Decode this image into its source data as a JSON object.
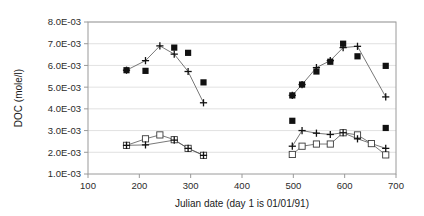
{
  "chart_data": {
    "type": "scatter",
    "title": "",
    "xlabel": "Julian date (day 1 is 01/01/91)",
    "ylabel": "DOC (mole/l)",
    "xlim": [
      100,
      700
    ],
    "ylim": [
      0.001,
      0.008
    ],
    "xticks": [
      100,
      200,
      300,
      400,
      500,
      600,
      700
    ],
    "xtick_labels": [
      "100",
      "200",
      "300",
      "400",
      "500",
      "600",
      "700"
    ],
    "yticks": [
      0.001,
      0.002,
      0.003,
      0.004,
      0.005,
      0.006,
      0.007,
      0.008
    ],
    "ytick_labels": [
      "1.0E-03",
      "2.0E-03",
      "3.0E-03",
      "4.0E-03",
      "5.0E-03",
      "6.0E-03",
      "7.0E-03",
      "8.0E-03"
    ],
    "grid": true,
    "grid_axis": "y",
    "legend": "none",
    "legend_position": "none",
    "marker_colors": {
      "filled_square": "#111111",
      "open_square": "#ffffff",
      "plus": "#111111",
      "line": "#555555"
    },
    "series": [
      {
        "name": "upper-filled-square",
        "marker": "filled-square",
        "connected": false,
        "x": [
          175,
          212,
          268,
          295,
          325,
          498,
          517,
          545,
          572,
          597,
          625,
          680
        ],
        "y": [
          0.00578,
          0.00575,
          0.00682,
          0.00658,
          0.00522,
          0.00462,
          0.00512,
          0.00572,
          0.00617,
          0.007,
          0.00642,
          0.00598
        ]
      },
      {
        "name": "upper-plus",
        "marker": "plus",
        "connected": true,
        "x": [
          175,
          212,
          240,
          268,
          295,
          325,
          498,
          517,
          545,
          572,
          597,
          625,
          680
        ],
        "y": [
          0.00578,
          0.00622,
          0.0069,
          0.00652,
          0.00572,
          0.00428,
          0.00462,
          0.00512,
          0.0059,
          0.00622,
          0.00682,
          0.00688,
          0.00455
        ]
      },
      {
        "name": "lower-open-square",
        "marker": "open-square",
        "connected": true,
        "x": [
          175,
          212,
          240,
          268,
          295,
          325,
          498,
          517,
          545,
          572,
          597,
          625,
          652,
          680
        ],
        "y": [
          0.00232,
          0.00262,
          0.0028,
          0.00258,
          0.00218,
          0.00186,
          0.0019,
          0.00228,
          0.00238,
          0.00238,
          0.0029,
          0.0028,
          0.0024,
          0.00188
        ]
      },
      {
        "name": "lower-plus",
        "marker": "plus",
        "connected": true,
        "x": [
          175,
          212,
          268,
          295,
          325,
          498,
          517,
          545,
          572,
          597,
          625,
          680
        ],
        "y": [
          0.00232,
          0.00234,
          0.00256,
          0.00218,
          0.00186,
          0.00228,
          0.003,
          0.00288,
          0.00282,
          0.0029,
          0.00262,
          0.00218
        ]
      },
      {
        "name": "lower-filled-square-isolated",
        "marker": "filled-square",
        "connected": false,
        "x": [
          498,
          680
        ],
        "y": [
          0.00345,
          0.00312
        ]
      }
    ]
  }
}
